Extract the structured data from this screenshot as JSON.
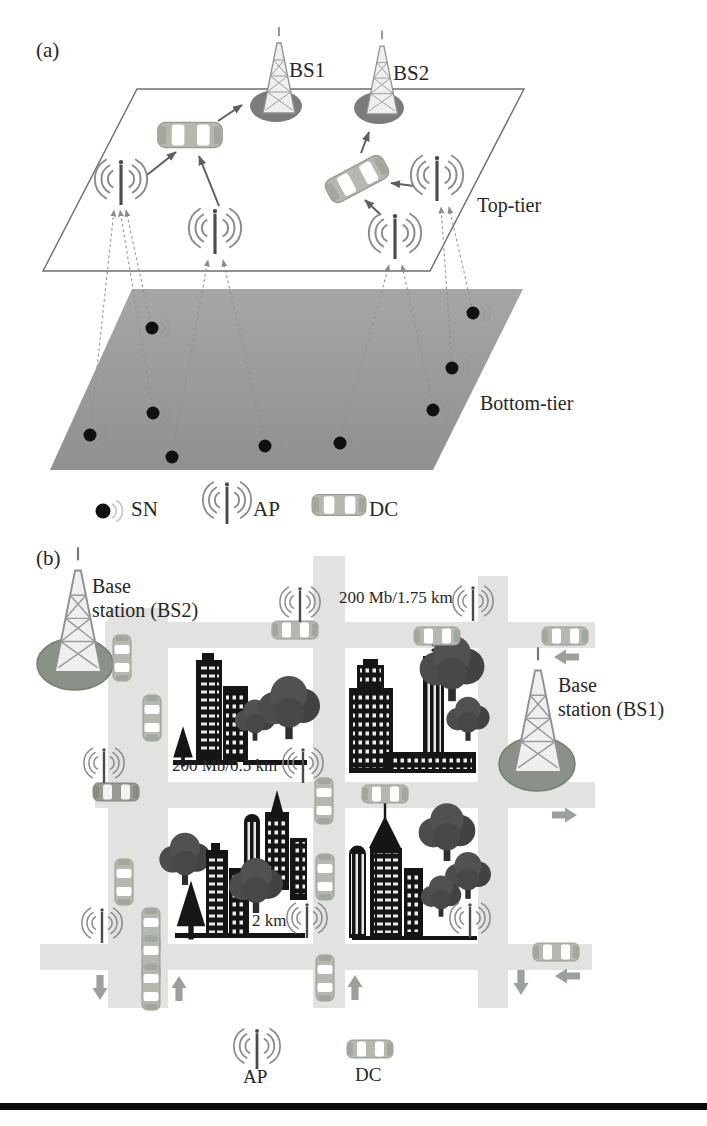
{
  "panel_a": {
    "label": "(a)",
    "bs1_label": "BS1",
    "bs2_label": "BS2",
    "top_tier_label": "Top-tier",
    "bottom_tier_label": "Bottom-tier",
    "legend": {
      "sn_label": "SN",
      "ap_label": "AP",
      "dc_label": "DC"
    }
  },
  "panel_b": {
    "label": "(b)",
    "bs2_label": "Base\nstation (BS2)",
    "bs1_label": "Base\nstation (BS1)",
    "link_top_label": "200 Mb/1.75 km",
    "link_left_label": "200 Mb/0.5 km",
    "link_bottom_label": "2 km",
    "legend": {
      "ap_label": "AP",
      "dc_label": "DC"
    }
  },
  "colors": {
    "road": "#e2e2e0",
    "bottom_tier_fill": "#9b9b9b",
    "base_ellipse_a": "#7b7b7b",
    "base_ellipse_b": "#8a9186",
    "car_body": "#b4b8af",
    "map_arrow": "#9aa09a",
    "ink": "#262626"
  }
}
